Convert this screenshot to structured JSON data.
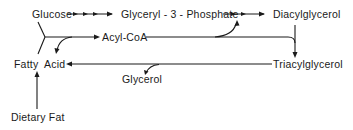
{
  "diagram": {
    "title": "",
    "nodes": {
      "glucose": {
        "label": "Glucose",
        "x": 32,
        "y": 18
      },
      "glyceryl3p": {
        "label": "Glyceryl - 3 - Phosphate",
        "x": 121,
        "y": 18
      },
      "diacylglycerol": {
        "label": "Diacylglycerol",
        "x": 273,
        "y": 18
      },
      "acylcoa": {
        "label": "Acyl-CoA",
        "x": 102,
        "y": 41
      },
      "triacylglycerol": {
        "label": "Triacylglycerol",
        "x": 273,
        "y": 68
      },
      "fattyacid": {
        "label": "Fatty  Acid",
        "x": 14,
        "y": 68
      },
      "glycerol": {
        "label": "Glycerol",
        "x": 122,
        "y": 83
      },
      "dietaryfat": {
        "label": "Dietary Fat",
        "x": 11,
        "y": 121
      }
    },
    "edges": [
      {
        "from": "Glucose",
        "to": "Glyceryl-3-Phosphate",
        "style": "multi-step arrow"
      },
      {
        "from": "Glyceryl-3-Phosphate",
        "to": "Diacylglycerol",
        "style": "multi-step arrow"
      },
      {
        "from": "Glucose",
        "to": "Acyl-CoA",
        "style": "solid arrow (via junction)"
      },
      {
        "from": "Fatty Acid",
        "to": "Acyl-CoA",
        "style": "solid arrow (via junction)"
      },
      {
        "from": "Acyl-CoA",
        "to": "Glyceryl-3-Phosphate → Diacylglycerol step",
        "style": "curved side-arrow"
      },
      {
        "from": "Acyl-CoA",
        "to": "Triacylglycerol",
        "style": "solid arrow (via Diacylglycerol)"
      },
      {
        "from": "Diacylglycerol",
        "to": "Triacylglycerol",
        "style": "solid arrow"
      },
      {
        "from": "Triacylglycerol",
        "to": "Fatty Acid",
        "style": "solid arrow"
      },
      {
        "from": "Triacylglycerol → Fatty Acid",
        "to": "Glycerol",
        "style": "curved side-branch"
      },
      {
        "from": "Dietary Fat",
        "to": "Fatty Acid",
        "style": "solid arrow"
      },
      {
        "from": "junction",
        "to": "Fatty Acid",
        "style": "curved side-arrow"
      }
    ]
  },
  "colors": {
    "ink": "#1a1a1a",
    "background": "#ffffff"
  }
}
